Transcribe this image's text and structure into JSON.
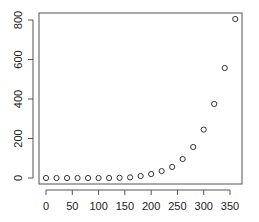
{
  "chart_data": {
    "type": "scatter",
    "title": "",
    "xlabel": "",
    "ylabel": "",
    "x": [
      0,
      20,
      40,
      60,
      80,
      100,
      120,
      140,
      160,
      180,
      200,
      220,
      240,
      260,
      280,
      300,
      320,
      340,
      360
    ],
    "y": [
      0,
      0,
      0,
      0,
      0,
      0,
      0,
      1,
      3,
      10,
      20,
      35,
      56,
      96,
      157,
      245,
      375,
      557,
      805
    ],
    "xticks": [
      0,
      50,
      100,
      150,
      200,
      250,
      300,
      350
    ],
    "yticks": [
      0,
      200,
      400,
      600,
      800
    ],
    "xlim": [
      -14,
      374
    ],
    "ylim": [
      -32,
      837
    ],
    "grid": false,
    "legend": null,
    "marker": "open-circle",
    "colors": {
      "marker": "#333333",
      "axis": "#555555",
      "text": "#222222",
      "background": "#ffffff"
    }
  }
}
